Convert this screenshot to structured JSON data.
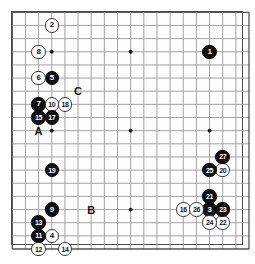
{
  "diagram": {
    "type": "go-game-record",
    "board_size": 19,
    "title": "",
    "geometry": {
      "origin_x": 12.3,
      "origin_y": 12.3,
      "spacing": 13.15,
      "stone_diameter": 14.5,
      "star_points": [
        {
          "col": 3,
          "row": 3
        },
        {
          "col": 9,
          "row": 3
        },
        {
          "col": 15,
          "row": 3
        },
        {
          "col": 3,
          "row": 9
        },
        {
          "col": 9,
          "row": 9
        },
        {
          "col": 15,
          "row": 9
        },
        {
          "col": 3,
          "row": 15
        },
        {
          "col": 9,
          "row": 15
        },
        {
          "col": 15,
          "row": 15
        }
      ]
    },
    "stones": [
      {
        "label": "1",
        "color": "black",
        "col": 15,
        "row": 3
      },
      {
        "label": "2",
        "color": "white",
        "col": 3,
        "row": 1
      },
      {
        "label": "3",
        "color": "black",
        "col": 15,
        "row": 15
      },
      {
        "label": "4",
        "color": "white",
        "col": 3,
        "row": 17
      },
      {
        "label": "5",
        "color": "black",
        "col": 3,
        "row": 5
      },
      {
        "label": "6",
        "color": "white",
        "col": 2,
        "row": 5
      },
      {
        "label": "7",
        "color": "black",
        "col": 2,
        "row": 7
      },
      {
        "label": "8",
        "color": "white",
        "col": 2,
        "row": 3
      },
      {
        "label": "9",
        "color": "black",
        "col": 3,
        "row": 15
      },
      {
        "label": "10",
        "color": "white",
        "col": 3,
        "row": 7
      },
      {
        "label": "11",
        "color": "black",
        "col": 2,
        "row": 17
      },
      {
        "label": "12",
        "color": "white",
        "col": 2,
        "row": 18
      },
      {
        "label": "13",
        "color": "black",
        "col": 2,
        "row": 16
      },
      {
        "label": "14",
        "color": "white",
        "col": 4,
        "row": 18
      },
      {
        "label": "15",
        "color": "black",
        "col": 2,
        "row": 8
      },
      {
        "label": "16",
        "color": "white",
        "col": 13,
        "row": 15
      },
      {
        "label": "17",
        "color": "black",
        "col": 3,
        "row": 8
      },
      {
        "label": "18",
        "color": "white",
        "col": 4,
        "row": 7
      },
      {
        "label": "19",
        "color": "black",
        "col": 3,
        "row": 12
      },
      {
        "label": "20",
        "color": "white",
        "col": 16,
        "row": 12
      },
      {
        "label": "21",
        "color": "black",
        "col": 15,
        "row": 14
      },
      {
        "label": "22",
        "color": "white",
        "col": 16,
        "row": 16
      },
      {
        "label": "23",
        "color": "black",
        "col": 16,
        "row": 15
      },
      {
        "label": "24",
        "color": "white",
        "col": 15,
        "row": 16
      },
      {
        "label": "25",
        "color": "black",
        "col": 15,
        "row": 12
      },
      {
        "label": "26",
        "color": "white",
        "col": 14,
        "row": 15
      },
      {
        "label": "27",
        "color": "black",
        "col": 16,
        "row": 11
      }
    ],
    "markers": [
      {
        "label": "A",
        "col": 2,
        "row": 9
      },
      {
        "label": "B",
        "col": 6,
        "row": 15
      },
      {
        "label": "C",
        "col": 5,
        "row": 6
      }
    ],
    "colors": {
      "black_stone": "#111111",
      "white_stone": "#ffffff",
      "stone_outline": "#333333",
      "grid_line": "#9a9a9a",
      "border": "#4a4a4a",
      "label_text": "#111111",
      "background": "#ffffff"
    }
  }
}
